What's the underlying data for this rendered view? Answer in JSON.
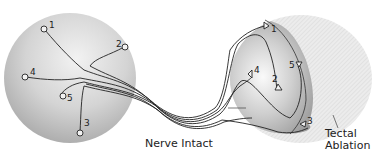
{
  "diagram": {
    "retina": {
      "sites": [
        {
          "id": "1",
          "label": "1"
        },
        {
          "id": "2",
          "label": "2"
        },
        {
          "id": "3",
          "label": "3"
        },
        {
          "id": "4",
          "label": "4"
        },
        {
          "id": "5",
          "label": "5"
        }
      ],
      "marker_shape": "circle"
    },
    "tectum": {
      "sites": [
        {
          "id": "1",
          "label": "1"
        },
        {
          "id": "2",
          "label": "2"
        },
        {
          "id": "3",
          "label": "3"
        },
        {
          "id": "4",
          "label": "4"
        },
        {
          "id": "5",
          "label": "5"
        }
      ],
      "marker_shape": "triangle"
    },
    "labels": {
      "nerve": "Nerve Intact",
      "ablation_line1": "Tectal",
      "ablation_line2": "Ablation"
    },
    "colors": {
      "line": "#222222",
      "sphere_light": "#f4f4f4",
      "sphere_dark": "#9a9a9a",
      "ablation": "#e6e6e6"
    }
  }
}
